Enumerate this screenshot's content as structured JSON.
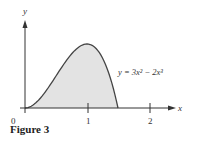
{
  "caption": "Figure 3",
  "chart_data": {
    "type": "area",
    "title": "",
    "xlabel": "x",
    "ylabel": "y",
    "origin_label": "0",
    "x_ticks": [
      "1",
      "2"
    ],
    "annotation": "y = 3x² − 2x³",
    "function": "y = 3x^2 - 2x^3",
    "shaded_region": {
      "x_from": 0,
      "x_to": 1.5
    },
    "x": [
      0,
      0.25,
      0.5,
      0.75,
      1.0,
      1.25,
      1.5
    ],
    "values": [
      0,
      0.156,
      0.5,
      0.844,
      1.0,
      0.781,
      0
    ],
    "xlim": [
      0,
      2.3
    ],
    "ylim": [
      0,
      1.5
    ],
    "grid": false,
    "fill_color": "#e3e3e3",
    "line_color": "#444444"
  }
}
